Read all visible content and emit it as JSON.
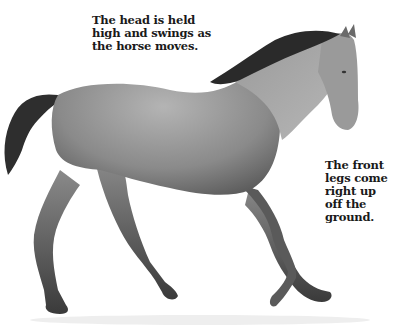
{
  "illustration": {
    "subject": "pencil drawing of a trotting horse",
    "colors": {
      "background": "#ffffff",
      "body_mid": "#8a8a8a",
      "body_dark": "#3a3a3a",
      "text": "#1a1a1a"
    }
  },
  "captions": {
    "head": {
      "lines": [
        "The head is held",
        "high and swings as",
        "the horse moves."
      ]
    },
    "front_legs": {
      "lines": [
        "The front",
        "legs come",
        "right up",
        "off the",
        "ground."
      ]
    }
  }
}
